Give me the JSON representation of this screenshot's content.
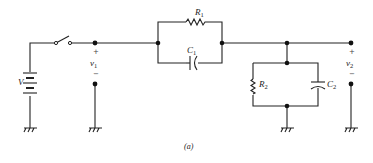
{
  "diagram": {
    "type": "circuit-schematic",
    "caption": "(a)",
    "colors": {
      "wire": "#222222",
      "background": "#ffffff"
    },
    "components": {
      "source": {
        "label": "V",
        "type": "battery"
      },
      "switch": {
        "type": "spst-switch",
        "state": "open"
      },
      "r1": {
        "label": "R",
        "sub": "1",
        "type": "resistor"
      },
      "c1": {
        "label": "C",
        "sub": "1",
        "type": "capacitor"
      },
      "r2": {
        "label": "R",
        "sub": "2",
        "type": "resistor"
      },
      "c2": {
        "label": "C",
        "sub": "2",
        "type": "capacitor"
      }
    },
    "voltages": {
      "v1": {
        "label": "v",
        "sub": "1",
        "plus": "+",
        "minus": "−"
      },
      "v2": {
        "label": "v",
        "sub": "2",
        "plus": "+",
        "minus": "−"
      }
    },
    "grounds": 4
  }
}
